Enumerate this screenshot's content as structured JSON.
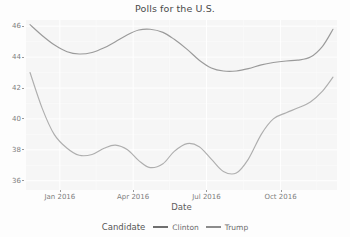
{
  "chart_data": {
    "type": "line",
    "title": "Polls for the U.S.",
    "xlabel": "Date",
    "ylabel": "",
    "ylim": [
      35.4,
      46.4
    ],
    "xlim": [
      "2015-11-20",
      "2016-12-10"
    ],
    "grid": true,
    "legend_position": "bottom",
    "legend_title": "Candidate",
    "yticks": [
      46,
      44,
      42,
      40,
      38,
      36
    ],
    "ytick_labels": [
      "46",
      "44",
      "42",
      "40",
      "38",
      "36"
    ],
    "xticks": [
      "2016-01-01",
      "2016-04-01",
      "2016-07-01",
      "2016-10-01"
    ],
    "xtick_labels": [
      "Jan 2016",
      "Apr 2016",
      "Jul 2016",
      "Oct 2016"
    ],
    "series": [
      {
        "name": "Clinton",
        "color": "#6f6f6f",
        "x": [
          "2015-11-25",
          "2015-12-10",
          "2015-12-25",
          "2016-01-10",
          "2016-01-25",
          "2016-02-10",
          "2016-02-25",
          "2016-03-10",
          "2016-03-25",
          "2016-04-08",
          "2016-04-22",
          "2016-05-08",
          "2016-05-22",
          "2016-06-07",
          "2016-06-22",
          "2016-07-07",
          "2016-07-22",
          "2016-08-07",
          "2016-08-22",
          "2016-09-07",
          "2016-09-22",
          "2016-10-08",
          "2016-10-22",
          "2016-11-07",
          "2016-11-22",
          "2016-12-05"
        ],
        "values": [
          46.1,
          45.4,
          44.8,
          44.35,
          44.2,
          44.3,
          44.6,
          45.0,
          45.45,
          45.75,
          45.8,
          45.6,
          45.15,
          44.5,
          43.8,
          43.3,
          43.1,
          43.1,
          43.25,
          43.5,
          43.65,
          43.75,
          43.8,
          44.0,
          44.7,
          45.8
        ]
      },
      {
        "name": "Trump",
        "color": "#8c8c8c",
        "x": [
          "2015-11-25",
          "2015-12-10",
          "2015-12-25",
          "2016-01-10",
          "2016-01-25",
          "2016-02-10",
          "2016-02-25",
          "2016-03-10",
          "2016-03-25",
          "2016-04-08",
          "2016-04-22",
          "2016-05-08",
          "2016-05-22",
          "2016-06-07",
          "2016-06-22",
          "2016-07-07",
          "2016-07-22",
          "2016-08-07",
          "2016-08-22",
          "2016-09-07",
          "2016-09-22",
          "2016-10-08",
          "2016-10-22",
          "2016-11-07",
          "2016-11-22",
          "2016-12-05"
        ],
        "values": [
          43.0,
          40.7,
          39.0,
          38.1,
          37.65,
          37.7,
          38.1,
          38.3,
          38.0,
          37.3,
          36.85,
          37.1,
          37.9,
          38.4,
          38.2,
          37.4,
          36.6,
          36.5,
          37.4,
          39.0,
          40.0,
          40.4,
          40.7,
          41.1,
          41.8,
          42.7
        ]
      }
    ]
  }
}
